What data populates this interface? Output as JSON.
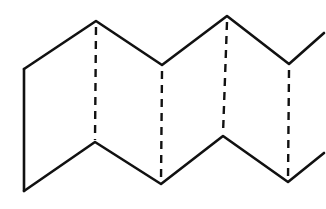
{
  "figure": {
    "description": "Accordion-folded (zigzag) paper strip line drawing",
    "stroke_color": "#111111",
    "background": "#ffffff",
    "dash_pattern": "8 6",
    "outline": {
      "top_edge": [
        [
          24,
          69
        ],
        [
          96,
          21
        ],
        [
          162,
          65
        ],
        [
          227,
          16
        ],
        [
          289,
          64
        ],
        [
          324,
          33
        ]
      ],
      "bottom_edge": [
        [
          24,
          191
        ],
        [
          95,
          142
        ],
        [
          161,
          184
        ],
        [
          223,
          136
        ],
        [
          288,
          182
        ],
        [
          324,
          153
        ]
      ],
      "left_edge": [
        [
          24,
          69
        ],
        [
          24,
          191
        ]
      ]
    },
    "fold_lines": [
      {
        "name": "fold-1",
        "type": "mountain",
        "from": [
          96,
          21
        ],
        "to": [
          95,
          142
        ]
      },
      {
        "name": "fold-2",
        "type": "valley",
        "from": [
          162,
          65
        ],
        "to": [
          161,
          184
        ]
      },
      {
        "name": "fold-3",
        "type": "mountain",
        "from": [
          227,
          16
        ],
        "to": [
          223,
          136
        ]
      },
      {
        "name": "fold-4",
        "type": "valley",
        "from": [
          289,
          64
        ],
        "to": [
          288,
          182
        ]
      }
    ]
  }
}
